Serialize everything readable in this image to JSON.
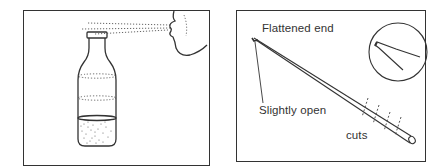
{
  "figure": {
    "panels": [
      {
        "id": "left",
        "description": "Person blowing across the top of a bottle partially filled with liquid",
        "elements": [
          "bottle",
          "liquid",
          "face-profile",
          "air-stream",
          "air-vibration-rings"
        ]
      },
      {
        "id": "right",
        "description": "Straw with flattened end and cuts, with magnified inset of the flattened tip",
        "labels": {
          "flattened_end": "Flattened end",
          "slightly_open": "Slightly open",
          "cuts": "cuts"
        },
        "elements": [
          "straw",
          "magnified-inset-circle",
          "cut-marks"
        ]
      }
    ],
    "colors": {
      "line": "#333333",
      "background": "#ffffff"
    }
  }
}
